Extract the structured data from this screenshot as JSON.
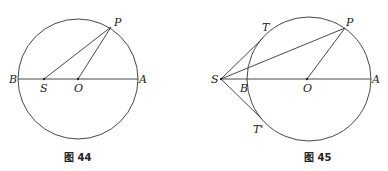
{
  "figures": [
    {
      "caption": "图 44",
      "labels": {
        "P": "P",
        "B": "B",
        "S": "S",
        "O": "O",
        "A": "A"
      }
    },
    {
      "caption": "图 45",
      "labels": {
        "T": "T",
        "P": "P",
        "S": "S",
        "B": "B",
        "O": "O",
        "A": "A",
        "T_prime": "T'"
      }
    }
  ]
}
